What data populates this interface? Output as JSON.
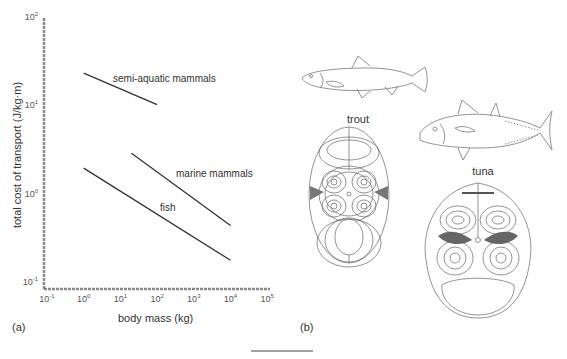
{
  "chart_data": {
    "type": "line",
    "title": "",
    "xlabel": "body mass (kg)",
    "ylabel": "total cost of transport (J/kg·m)",
    "xscale": "log",
    "yscale": "log",
    "xlim": [
      0.1,
      100000
    ],
    "ylim": [
      0.1,
      100
    ],
    "grid": false,
    "legend": "inline labels",
    "x_ticks": [
      {
        "base": "10",
        "exp": "-1"
      },
      {
        "base": "10",
        "exp": "0"
      },
      {
        "base": "10",
        "exp": "1"
      },
      {
        "base": "10",
        "exp": "2"
      },
      {
        "base": "10",
        "exp": "3"
      },
      {
        "base": "10",
        "exp": "4"
      },
      {
        "base": "10",
        "exp": "5"
      }
    ],
    "y_ticks": [
      {
        "base": "10",
        "exp": "2"
      },
      {
        "base": "10",
        "exp": "1"
      },
      {
        "base": "10",
        "exp": "0"
      },
      {
        "base": "10",
        "exp": "-1"
      }
    ],
    "series": [
      {
        "name": "semi-aquatic mammals",
        "x": [
          1,
          100
        ],
        "y": [
          25,
          11
        ]
      },
      {
        "name": "marine mammals",
        "x": [
          20,
          10000
        ],
        "y": [
          3.1,
          0.47
        ]
      },
      {
        "name": "fish",
        "x": [
          1,
          10000
        ],
        "y": [
          2.1,
          0.19
        ]
      }
    ]
  },
  "panels": {
    "a_label": "(a)",
    "b_label": "(b)"
  },
  "fish": {
    "trout_label": "trout",
    "tuna_label": "tuna"
  }
}
